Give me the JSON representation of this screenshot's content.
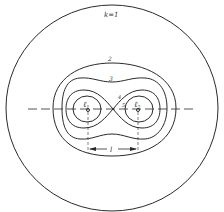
{
  "diagram": {
    "type": "cassini-ovals",
    "curve_labels": {
      "outer": "k=1",
      "c2": "2",
      "c3": "3",
      "c4": "4",
      "c5": "5"
    },
    "foci": {
      "left": {
        "label": "ℓ",
        "sub": "1"
      },
      "right": {
        "label": "ℓ",
        "sub": "2"
      }
    },
    "dimension_label": "l",
    "colors": {
      "line": "#2a2a2a",
      "background": "#ffffff"
    }
  }
}
